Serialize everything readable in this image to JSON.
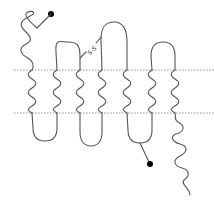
{
  "diagram": {
    "type": "seven-transmembrane-protein-topology",
    "membrane": {
      "lines": [
        "extracellular-boundary",
        "intracellular-boundary"
      ],
      "line_style": "dotted",
      "color": "#888888"
    },
    "helix_count": 7,
    "labels": {
      "disulfide": "S-S"
    },
    "terminals": {
      "n_terminus": "extracellular, ending in filled dot",
      "c_terminus": "intracellular, wavy tail"
    },
    "markers": [
      {
        "name": "n-terminal-dot",
        "color": "#000000"
      },
      {
        "name": "intracellular-loop-dot",
        "color": "#000000"
      }
    ],
    "chain_color": "#555555"
  }
}
